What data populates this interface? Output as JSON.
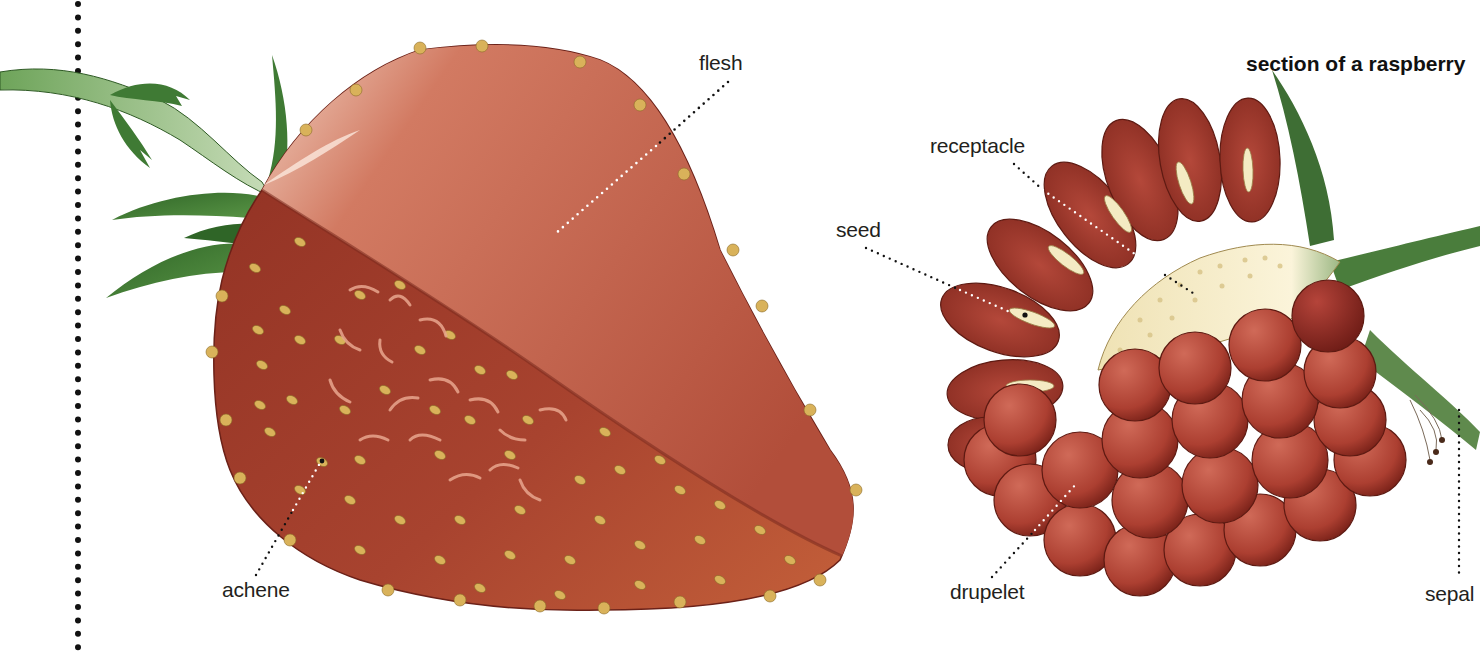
{
  "title": "section of a raspberry",
  "strawberry": {
    "labels": {
      "flesh": "flesh",
      "achene": "achene"
    }
  },
  "raspberry": {
    "labels": {
      "receptacle": "receptacle",
      "seed": "seed",
      "drupelet": "drupelet",
      "sepal": "sepal"
    }
  },
  "colors": {
    "skin": "#9e3a2c",
    "flesh": "#c0604c",
    "flesh_highlight": "#f3d7c8",
    "achene": "#d9b25a",
    "leaf": "#3f7a34",
    "stem": "#4f8a3c",
    "drupelet": "#b54738",
    "receptacle": "#f2e8c2",
    "seed": "#f4ebc3",
    "leader_dark": "#111111",
    "leader_light": "#ffffff"
  }
}
